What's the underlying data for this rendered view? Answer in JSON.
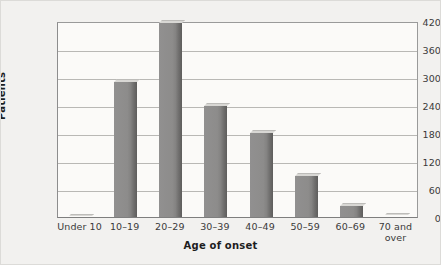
{
  "chart_data": {
    "type": "bar",
    "title": "",
    "subtitle": "",
    "xlabel": "Age of onset",
    "ylabel": "Patients",
    "categories": [
      "Under 10",
      "10–19",
      "20–29",
      "30–39",
      "40–49",
      "50–59",
      "60–69",
      "70 and\nover"
    ],
    "values": [
      2,
      290,
      415,
      237,
      181,
      88,
      24,
      5
    ],
    "ylim": [
      0,
      420
    ],
    "yticks": [
      0,
      60,
      120,
      180,
      240,
      300,
      360,
      420
    ],
    "ytick_labels": [
      "0",
      "60",
      "120",
      "180",
      "240",
      "300",
      "360",
      "420"
    ],
    "grid": "horizontal",
    "legend": "none",
    "series": [
      {
        "name": "Patients",
        "values": [
          2,
          290,
          415,
          237,
          181,
          88,
          24,
          5
        ]
      }
    ],
    "colors": {
      "bar_face": "#8d8c8b",
      "bar_side": "#5e5d5c",
      "bar_top": "#d8d7d4",
      "plot_background": "#fbfaf8",
      "figure_background": "#f2f1ef",
      "gridline": "#b9b8b5",
      "axis": "#8d8d8d",
      "text": "#3a3a3a"
    }
  }
}
